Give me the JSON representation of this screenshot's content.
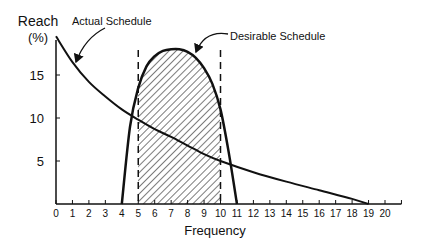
{
  "chart_data": {
    "type": "line",
    "title": "",
    "xlabel": "Frequency",
    "ylabel": "Reach (%)",
    "ylabel_line1": "Reach",
    "ylabel_line2": "(%)",
    "xlim": [
      0,
      21
    ],
    "ylim": [
      0,
      20
    ],
    "x_ticks": [
      "0",
      "1",
      "2",
      "3",
      "4",
      "5",
      "6",
      "7",
      "8",
      "9",
      "10",
      "11",
      "12",
      "13",
      "14",
      "15",
      "16",
      "17",
      "18",
      "19",
      "20"
    ],
    "y_ticks": [
      "5",
      "10",
      "15"
    ],
    "grid": false,
    "series": [
      {
        "name": "Actual Schedule",
        "x": [
          0,
          1,
          2,
          3,
          4,
          5,
          6,
          7,
          8,
          9,
          10,
          12,
          14,
          16,
          18,
          19
        ],
        "values": [
          19.5,
          16.5,
          14.2,
          12.5,
          11.0,
          9.8,
          8.7,
          7.8,
          6.8,
          5.8,
          5.0,
          3.7,
          2.6,
          1.6,
          0.6,
          0
        ]
      },
      {
        "name": "Desirable Schedule",
        "x": [
          4,
          4.5,
          5,
          5.5,
          6,
          6.5,
          7,
          7.5,
          8,
          8.5,
          9,
          9.5,
          10,
          10.5,
          11
        ],
        "values": [
          0,
          9,
          13.5,
          16,
          17.2,
          17.8,
          18,
          18,
          17.7,
          17,
          15.8,
          14,
          11,
          6,
          0
        ]
      }
    ],
    "annotations": [
      {
        "text": "Actual Schedule",
        "points_to": "Actual Schedule curve near x=1"
      },
      {
        "text": "Desirable Schedule",
        "points_to": "Desirable Schedule peak near x=7.5"
      }
    ],
    "shaded_region": {
      "x_from": 5,
      "x_to": 10,
      "under": "Desirable Schedule",
      "style": "diagonal hatch"
    },
    "reference_lines": [
      {
        "x": 5,
        "style": "dashed"
      },
      {
        "x": 10,
        "style": "dashed"
      }
    ]
  }
}
